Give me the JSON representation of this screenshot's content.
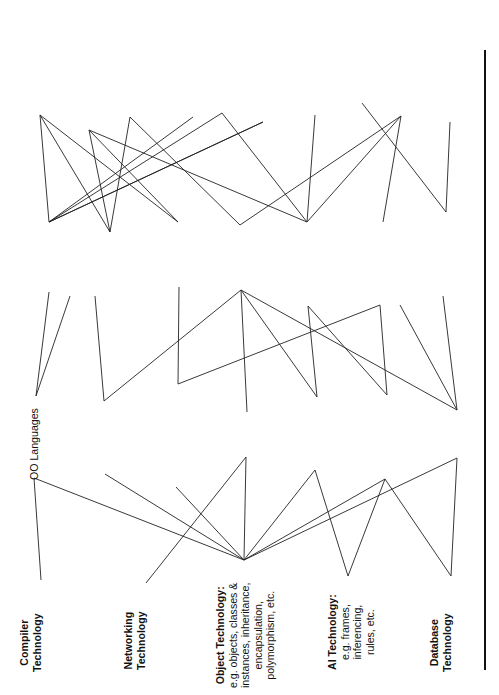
{
  "diagram": {
    "orientation": "rotated-90-ccw",
    "line_color": "#222222",
    "technologies": [
      {
        "id": "compiler",
        "lines": [
          {
            "text": "Compiler",
            "bold": true
          },
          {
            "text": "Technology",
            "bold": true
          }
        ],
        "anchor": [
          41,
          580
        ],
        "x": 18,
        "y": 672
      },
      {
        "id": "networking",
        "lines": [
          {
            "text": "Networking",
            "bold": true
          },
          {
            "text": "Technology",
            "bold": true
          }
        ],
        "anchor": [
          146,
          583
        ],
        "x": 122,
        "y": 670
      },
      {
        "id": "object",
        "lines": [
          {
            "text": "Object Technology:",
            "bold": true
          },
          {
            "text": "e.g. objects, classes &"
          },
          {
            "text": "instances, inheritance,"
          },
          {
            "text": "encapsulation,"
          },
          {
            "text": "polymorphism, etc."
          }
        ],
        "anchor": [
          244,
          560
        ],
        "x": 214,
        "y": 688
      },
      {
        "id": "ai",
        "lines": [
          {
            "text": "AI Technology:",
            "bold": true
          },
          {
            "text": "e.g. frames,"
          },
          {
            "text": "inferencing,"
          },
          {
            "text": "rules, etc."
          }
        ],
        "anchor": [
          348,
          576
        ],
        "x": 326,
        "y": 670
      },
      {
        "id": "database",
        "lines": [
          {
            "text": "Database",
            "bold": true
          },
          {
            "text": "Technology",
            "bold": true
          }
        ],
        "anchor": [
          451,
          576
        ],
        "x": 428,
        "y": 672
      }
    ],
    "categories": [
      {
        "id": "oo_languages",
        "label": "OO Languages",
        "top": [
          36,
          396
        ],
        "bottom": [
          34,
          478
        ],
        "x": 28,
        "y": 480
      },
      {
        "id": "components",
        "label": "Components",
        "top": [
          104,
          401
        ],
        "bottom": [
          105,
          474
        ],
        "x": 97,
        "y": 472
      },
      {
        "id": "oo_methodologies",
        "label": "OO Methodologies",
        "top": [
          178,
          384
        ],
        "bottom": [
          176,
          487
        ],
        "x": 170,
        "y": 485
      },
      {
        "id": "orbs",
        "label": "ORBs",
        "top": [
          247,
          412
        ],
        "bottom": [
          246,
          457
        ],
        "x": 239,
        "y": 455
      },
      {
        "id": "oo_4gl",
        "label": "OO 4GL Tools",
        "top": [
          317,
          397
        ],
        "bottom": [
          315,
          470
        ],
        "x": 309,
        "y": 468
      },
      {
        "id": "oo_case",
        "label": "OO CASE Tools",
        "top": [
          387,
          395
        ],
        "bottom": [
          385,
          479
        ],
        "x": 379,
        "y": 477
      },
      {
        "id": "oodbs",
        "label": "OODBs",
        "top": [
          457,
          410
        ],
        "bottom": [
          457,
          458
        ],
        "x": 450,
        "y": 456
      }
    ],
    "products": [
      {
        "id": "languages",
        "lines": [
          "C++",
          "Smalltalk",
          "OO Cobol"
        ],
        "top": [
          49,
          222
        ],
        "bottom": [
          47,
          295
        ],
        "x": 30,
        "y": 290
      },
      {
        "id": "components",
        "lines": [
          "OLE VBXs",
          "Smalltalk Classes",
          "Business Object",
          "Frameworks"
        ],
        "top": [
          110,
          232
        ],
        "bottom": [
          95,
          296
        ],
        "x": 88,
        "y": 292
      },
      {
        "id": "methodologies",
        "lines": [
          "Booch",
          "Rumbaugh",
          "Jacobson"
        ],
        "top": [
          178,
          222
        ],
        "bottom": [
          179,
          287
        ],
        "x": 160,
        "y": 282
      },
      {
        "id": "orbs",
        "lines": [
          "Orbix SOM",
          "ObjectBroker"
        ],
        "top": [
          240,
          225
        ],
        "bottom": [
          241,
          290
        ],
        "x": 232,
        "y": 282
      },
      {
        "id": "4gl",
        "lines": [
          "Visual Basic",
          "PowerBuilder",
          "VisualAge Forte Kappa"
        ],
        "top": [
          307,
          222
        ],
        "bottom": [
          308,
          306
        ],
        "x": 292,
        "y": 302
      },
      {
        "id": "case",
        "lines": [
          "Protosoft",
          "Object Mang.",
          "Workbench",
          "Software Thru Pictures"
        ],
        "top": [
          383,
          222
        ],
        "bottom": [
          379,
          305
        ],
        "x": 355,
        "y": 302
      },
      {
        "id": "oodb",
        "lines": [
          "ObjectStore",
          "Gemstone",
          "UniSQL Versant"
        ],
        "top": [
          446,
          212
        ],
        "bottom": [
          443,
          296
        ],
        "x": 428,
        "y": 290
      }
    ],
    "benefits": [
      {
        "id": "ease",
        "lines": [
          "Ease of",
          "Development"
        ],
        "anchor": [
          40,
          115
        ],
        "x": 28,
        "y": 110
      },
      {
        "id": "standard",
        "lines": [
          "Standardization",
          "Protects Investments"
        ],
        "anchor": [
          89,
          130
        ],
        "x": 76,
        "y": 124
      },
      {
        "id": "speed",
        "lines": [
          "Speed of",
          "Development",
          "Easy to Update",
          "and Extend"
        ],
        "anchor": [
          130,
          117
        ],
        "x": 146,
        "y": 112
      },
      {
        "id": "productivity",
        "lines": [
          "Improved",
          "Productivity"
        ],
        "anchor": [
          222,
          113
        ],
        "x": 212,
        "y": 108
      },
      {
        "id": "runtime",
        "lines": [
          "Greater Runtime",
          "Efficiency"
        ],
        "anchor": [
          263,
          122
        ],
        "x": 259,
        "y": 118
      },
      {
        "id": "reuse",
        "lines": [
          "Code Reuse"
        ],
        "anchor": [
          315,
          115
        ],
        "x": 309,
        "y": 110
      },
      {
        "id": "quality",
        "lines": [
          "Improved",
          "Quality"
        ],
        "anchor": [
          362,
          103
        ],
        "x": 352,
        "y": 98
      },
      {
        "id": "distributed",
        "lines": [
          "Distributed",
          "Corporate Systems"
        ],
        "anchor": [
          401,
          116
        ],
        "x": 396,
        "y": 124
      },
      {
        "id": "newapps",
        "lines": [
          "New Applications",
          "Possible"
        ],
        "anchor": [
          450,
          122
        ],
        "x": 440,
        "y": 118
      }
    ],
    "connections": [
      [
        41,
        580,
        34,
        478
      ],
      [
        146,
        583,
        246,
        457
      ],
      [
        451,
        576,
        457,
        458
      ],
      [
        244,
        560,
        34,
        478
      ],
      [
        244,
        560,
        105,
        474
      ],
      [
        244,
        560,
        176,
        487
      ],
      [
        244,
        560,
        246,
        457
      ],
      [
        244,
        560,
        315,
        470
      ],
      [
        244,
        560,
        385,
        479
      ],
      [
        244,
        560,
        457,
        458
      ],
      [
        348,
        576,
        315,
        470
      ],
      [
        348,
        576,
        385,
        479
      ],
      [
        451,
        576,
        385,
        479
      ],
      [
        36,
        396,
        49,
        292
      ],
      [
        36,
        396,
        70,
        296
      ],
      [
        104,
        401,
        95,
        296
      ],
      [
        104,
        401,
        241,
        290
      ],
      [
        178,
        384,
        179,
        287
      ],
      [
        178,
        384,
        380,
        305
      ],
      [
        247,
        412,
        241,
        290
      ],
      [
        317,
        397,
        308,
        306
      ],
      [
        317,
        397,
        241,
        290
      ],
      [
        387,
        395,
        380,
        305
      ],
      [
        387,
        395,
        308,
        306
      ],
      [
        457,
        410,
        400,
        305
      ],
      [
        457,
        410,
        443,
        296
      ],
      [
        457,
        410,
        241,
        290
      ],
      [
        49,
        222,
        40,
        115
      ],
      [
        49,
        222,
        193,
        117
      ],
      [
        49,
        222,
        222,
        113
      ],
      [
        49,
        222,
        263,
        122
      ],
      [
        40,
        115,
        110,
        232
      ],
      [
        40,
        115,
        178,
        222
      ],
      [
        89,
        130,
        110,
        232
      ],
      [
        89,
        130,
        178,
        222
      ],
      [
        89,
        130,
        307,
        222
      ],
      [
        130,
        117,
        110,
        232
      ],
      [
        130,
        117,
        240,
        225
      ],
      [
        222,
        113,
        307,
        222
      ],
      [
        263,
        122,
        49,
        222
      ],
      [
        315,
        115,
        307,
        222
      ],
      [
        362,
        103,
        446,
        212
      ],
      [
        401,
        116,
        307,
        222
      ],
      [
        401,
        116,
        240,
        225
      ],
      [
        401,
        116,
        383,
        222
      ],
      [
        450,
        122,
        446,
        212
      ]
    ]
  }
}
